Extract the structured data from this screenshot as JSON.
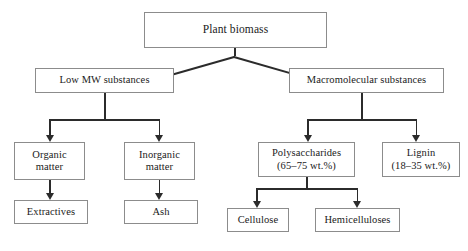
{
  "diagram": {
    "type": "flowchart-tree",
    "colors": {
      "background": "#ffffff",
      "box_border": "#8c8c8c",
      "connector": "#2b2b2b",
      "text": "#1a1a1a"
    },
    "nodes": {
      "root": {
        "label": "Plant biomass"
      },
      "low_mw": {
        "label": "Low MW substances"
      },
      "macromolecular": {
        "label": "Macromolecular substances"
      },
      "organic_matter": {
        "line1": "Organic",
        "line2": "matter"
      },
      "inorganic_matter": {
        "line1": "Inorganic",
        "line2": "matter"
      },
      "extractives": {
        "label": "Extractives"
      },
      "ash": {
        "label": "Ash"
      },
      "polysaccharides": {
        "line1": "Polysaccharides",
        "line2": "(65–75 wt.%)"
      },
      "lignin": {
        "line1": "Lignin",
        "line2": "(18–35 wt.%)"
      },
      "cellulose": {
        "label": "Cellulose"
      },
      "hemicelluloses": {
        "label": "Hemicelluloses"
      }
    },
    "edges": [
      {
        "from": "root",
        "to": "low_mw",
        "style": "diagonal-arrow"
      },
      {
        "from": "root",
        "to": "macromolecular",
        "style": "diagonal-arrow"
      },
      {
        "from": "low_mw",
        "to": "organic_matter",
        "style": "orthogonal-arrow"
      },
      {
        "from": "low_mw",
        "to": "inorganic_matter",
        "style": "orthogonal-arrow"
      },
      {
        "from": "organic_matter",
        "to": "extractives",
        "style": "straight-arrow"
      },
      {
        "from": "inorganic_matter",
        "to": "ash",
        "style": "straight-arrow"
      },
      {
        "from": "macromolecular",
        "to": "polysaccharides",
        "style": "orthogonal-arrow"
      },
      {
        "from": "macromolecular",
        "to": "lignin",
        "style": "orthogonal-arrow"
      },
      {
        "from": "polysaccharides",
        "to": "cellulose",
        "style": "orthogonal-arrow"
      },
      {
        "from": "polysaccharides",
        "to": "hemicelluloses",
        "style": "orthogonal-arrow"
      }
    ]
  }
}
